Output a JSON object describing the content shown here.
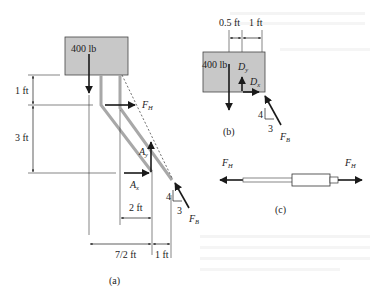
{
  "figure": {
    "panels": [
      {
        "id": "a",
        "caption": "(a)"
      },
      {
        "id": "b",
        "caption": "(b)"
      },
      {
        "id": "c",
        "caption": "(c)"
      }
    ],
    "colors": {
      "block_fill": "#c8c8c8",
      "block_stroke": "#444444",
      "member_gray": "#a8a8a8",
      "ink": "#1a1a1a"
    }
  },
  "panel_a": {
    "load_label": "400 lb",
    "dims": {
      "top_vertical": "1 ft",
      "lower_vertical": "3 ft",
      "horiz_2": "2 ft",
      "horiz_7_2": "7/2 ft",
      "horiz_1": "1 ft"
    },
    "forces": {
      "FH": {
        "base": "F",
        "sub": "H"
      },
      "Ax": {
        "base": "A",
        "sub": "x"
      },
      "Ay": {
        "base": "A",
        "sub": "y"
      },
      "FB": {
        "base": "F",
        "sub": "B"
      }
    },
    "slope": {
      "rise": "4",
      "run": "3"
    }
  },
  "panel_b": {
    "load_label": "400 lb",
    "dims": {
      "left": "0.5 ft",
      "right": "1 ft"
    },
    "forces": {
      "Dy": {
        "base": "D",
        "sub": "y"
      },
      "Dx": {
        "base": "D",
        "sub": "x"
      },
      "FB": {
        "base": "F",
        "sub": "B"
      }
    },
    "slope": {
      "rise": "4",
      "run": "3"
    }
  },
  "panel_c": {
    "forces": {
      "FH_left": {
        "base": "F",
        "sub": "H"
      },
      "FH_right": {
        "base": "F",
        "sub": "H"
      }
    }
  }
}
